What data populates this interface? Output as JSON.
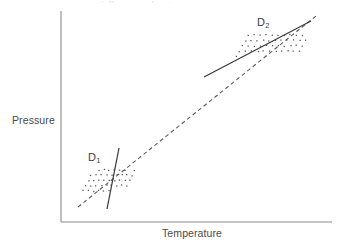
{
  "figure": {
    "background_color": "#ffffff",
    "axis_color": "#8a8a8a",
    "point_color": "#5a5a5a",
    "solid_line_color": "#3a3a3a",
    "dashed_line_color": "#5c5c5c",
    "top_edge_artifact": "partially cropped text"
  },
  "labels": {
    "ylabel": "Pressure",
    "xlabel": "Temperature",
    "cluster_1_base": "D",
    "cluster_1_sub": "1",
    "cluster_2_base": "D",
    "cluster_2_sub": "2"
  },
  "chart_data": {
    "type": "scatter",
    "title": "",
    "xlabel": "Temperature",
    "ylabel": "Pressure",
    "grid": false,
    "legend": "none",
    "axis_ticks": "none",
    "axis_numbers": "none",
    "xlim": [
      61,
      332
    ],
    "ylim": [
      11,
      222
    ],
    "series": [
      {
        "name": "D1",
        "label": "D",
        "subscript": "1",
        "marker": "small-dot",
        "point_count": 40,
        "cluster_bbox": [
          82,
          168,
          128,
          192
        ],
        "label_position": [
          88,
          151
        ],
        "points_grid": {
          "x_start": 83,
          "x_step": 5.2,
          "cols": 9,
          "y_start": 170,
          "y_step": 5.2,
          "rows": 5,
          "shear_per_row": 2.6,
          "jitter": 0.7
        }
      },
      {
        "name": "D2",
        "label": "D",
        "subscript": "2",
        "marker": "small-dot",
        "point_count": 44,
        "cluster_bbox": [
          235,
          33,
          306,
          57
        ],
        "label_position": [
          257,
          16
        ],
        "points_grid": {
          "x_start": 237,
          "x_step": 6.0,
          "cols": 11,
          "y_start": 35,
          "y_step": 5.4,
          "rows": 5,
          "shear_per_row": 2.8,
          "jitter": 0.7
        }
      }
    ],
    "lines": [
      {
        "name": "pooled-regression-line",
        "style": "dashed",
        "x1": 78,
        "y1": 207,
        "x2": 316,
        "y2": 16,
        "slope_sign": "positive",
        "description": "Steep pooled regression across both clusters"
      },
      {
        "name": "d1-within-regression-line",
        "style": "solid",
        "x1": 119,
        "y1": 148,
        "x2": 107,
        "y2": 209,
        "slope_sign": "negative-steep",
        "description": "Very steep line through cluster D1"
      },
      {
        "name": "d2-within-regression-line",
        "style": "solid",
        "x1": 204,
        "y1": 77,
        "x2": 311,
        "y2": 21,
        "slope_sign": "positive-shallow",
        "description": "Shallower line through cluster D2"
      }
    ],
    "axes": [
      {
        "name": "y-axis",
        "x1": 61,
        "y1": 11,
        "x2": 61,
        "y2": 222
      },
      {
        "name": "x-axis",
        "x1": 61,
        "y1": 222,
        "x2": 332,
        "y2": 222
      }
    ]
  }
}
